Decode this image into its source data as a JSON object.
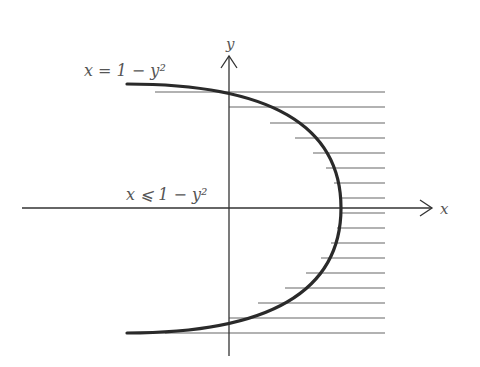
{
  "figure": {
    "type": "region-diagram",
    "labels": {
      "curve": "x = 1 − y²",
      "region": "x ⩽ 1 − y²",
      "x_axis": "x",
      "y_axis": "y"
    },
    "curve_equation": "x = 1 - y^2",
    "region_inequality": "x <= 1 - y^2",
    "shading": "horizontal hatching outside (right of) the parabola",
    "colors": {
      "curve": "#2a2a2a",
      "axes": "#333333",
      "hatch": "#666666",
      "text": "#555555"
    }
  }
}
